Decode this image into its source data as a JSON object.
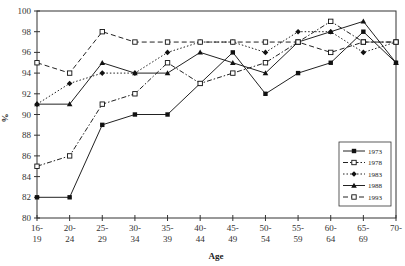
{
  "chart_data": {
    "type": "line",
    "title": "",
    "xlabel": "Age",
    "ylabel": "%",
    "ylim": [
      80,
      100
    ],
    "yticks": [
      80,
      82,
      84,
      86,
      88,
      90,
      92,
      94,
      96,
      98,
      100
    ],
    "grid": false,
    "legend_position": "right-inside",
    "categories": [
      "16-19",
      "20-24",
      "25-29",
      "30-34",
      "35-39",
      "40-44",
      "45-49",
      "50-54",
      "55-59",
      "60-64",
      "65-69",
      "70-"
    ],
    "category_lines": [
      [
        "16-",
        "19"
      ],
      [
        "20-",
        "24"
      ],
      [
        "25-",
        "29"
      ],
      [
        "30-",
        "34"
      ],
      [
        "35-",
        "39"
      ],
      [
        "40-",
        "44"
      ],
      [
        "45-",
        "49"
      ],
      [
        "50-",
        "54"
      ],
      [
        "55-",
        "59"
      ],
      [
        "60-",
        "64"
      ],
      [
        "65-",
        "69"
      ],
      [
        "70-",
        ""
      ]
    ],
    "series": [
      {
        "name": "1973",
        "style": "solid",
        "marker": "filled-square",
        "values": [
          82,
          82,
          89,
          90,
          90,
          93,
          96,
          92,
          94,
          95,
          98,
          95
        ]
      },
      {
        "name": "1978",
        "style": "dash-dot",
        "marker": "open-square",
        "values": [
          85,
          86,
          91,
          92,
          95,
          93,
          94,
          95,
          97,
          99,
          97,
          97
        ]
      },
      {
        "name": "1983",
        "style": "dotted",
        "marker": "filled-diamond",
        "values": [
          91,
          93,
          94,
          94,
          96,
          97,
          97,
          96,
          98,
          98,
          96,
          97
        ]
      },
      {
        "name": "1988",
        "style": "solid",
        "marker": "filled-triangle",
        "values": [
          91,
          91,
          95,
          94,
          94,
          96,
          95,
          94,
          97,
          98,
          99,
          95
        ]
      },
      {
        "name": "1993",
        "style": "dashed",
        "marker": "open-square",
        "values": [
          95,
          94,
          98,
          97,
          97,
          97,
          97,
          97,
          97,
          96,
          97,
          97
        ]
      }
    ]
  }
}
